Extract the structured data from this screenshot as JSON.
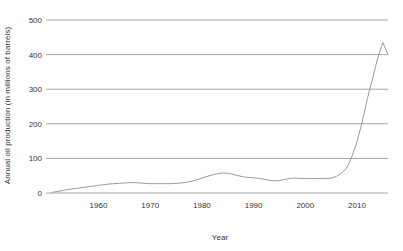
{
  "chart_data": {
    "type": "line",
    "title": "",
    "xlabel": "Year",
    "ylabel": "Annual oil production (in millions of barrels)",
    "xlim": [
      1951,
      2016
    ],
    "ylim": [
      0,
      500
    ],
    "grid": true,
    "legend": "none",
    "x_ticks": [
      "1960",
      "1970",
      "1980",
      "1990",
      "2000",
      "2010"
    ],
    "x_tick_values": [
      1960,
      1970,
      1980,
      1990,
      2000,
      2010
    ],
    "y_ticks": [
      "0",
      "100",
      "200",
      "300",
      "400",
      "500"
    ],
    "y_tick_values": [
      0,
      100,
      200,
      300,
      400,
      500
    ],
    "series": [
      {
        "name": "Annual oil production",
        "color": "#9b9b9b",
        "x": [
          1951,
          1952,
          1953,
          1954,
          1955,
          1956,
          1957,
          1958,
          1959,
          1960,
          1961,
          1962,
          1963,
          1964,
          1965,
          1966,
          1967,
          1968,
          1969,
          1970,
          1971,
          1972,
          1973,
          1974,
          1975,
          1976,
          1977,
          1978,
          1979,
          1980,
          1981,
          1982,
          1983,
          1984,
          1985,
          1986,
          1987,
          1988,
          1989,
          1990,
          1991,
          1992,
          1993,
          1994,
          1995,
          1996,
          1997,
          1998,
          1999,
          2000,
          2001,
          2002,
          2003,
          2004,
          2005,
          2006,
          2007,
          2008,
          2009,
          2010,
          2011,
          2012,
          2013,
          2014,
          2015,
          2016
        ],
        "values": [
          2,
          4,
          7,
          10,
          12,
          14,
          16,
          18,
          20,
          22,
          24,
          26,
          27,
          28,
          29,
          30,
          30,
          29,
          28,
          27,
          27,
          27,
          27,
          27,
          28,
          29,
          31,
          34,
          38,
          43,
          48,
          52,
          56,
          58,
          57,
          54,
          50,
          47,
          45,
          44,
          42,
          40,
          37,
          35,
          36,
          39,
          42,
          43,
          42,
          42,
          42,
          42,
          42,
          42,
          43,
          48,
          57,
          72,
          104,
          148,
          205,
          272,
          330,
          390,
          435,
          400
        ]
      }
    ]
  },
  "axes": {
    "y_axis_title": "Annual oil production (in millions of barrels)",
    "x_axis_title": "Year"
  }
}
